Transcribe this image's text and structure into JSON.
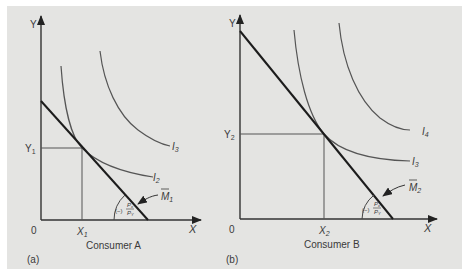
{
  "figure": {
    "background": "#e4e4e2",
    "line_color": "#222222",
    "curve_color": "#555555",
    "panels": [
      {
        "id": "a",
        "tag": "(a)",
        "title": "Consumer A",
        "y_axis_label": "Y",
        "x_axis_label": "X",
        "origin_label": "0",
        "y_level_label": "Y",
        "y_level_sub": "1",
        "x_level_label": "X",
        "x_level_sub": "1",
        "budget_label": "M",
        "budget_sub": "1",
        "slope_label_sign": "(−)",
        "slope_num": "P",
        "slope_num_sub": "x",
        "slope_den": "P",
        "slope_den_sub": "Y",
        "curves": [
          {
            "name": "I",
            "sub": "2"
          },
          {
            "name": "I",
            "sub": "3"
          }
        ]
      },
      {
        "id": "b",
        "tag": "(b)",
        "title": "Consumer B",
        "y_axis_label": "Y",
        "x_axis_label": "X",
        "origin_label": "0",
        "y_level_label": "Y",
        "y_level_sub": "2",
        "x_level_label": "X",
        "x_level_sub": "2",
        "budget_label": "M",
        "budget_sub": "2",
        "slope_label_sign": "(−)",
        "slope_num": "P",
        "slope_num_sub": "x",
        "slope_den": "P",
        "slope_den_sub": "Y",
        "curves": [
          {
            "name": "I",
            "sub": "3"
          },
          {
            "name": "I",
            "sub": "4"
          }
        ]
      }
    ]
  }
}
